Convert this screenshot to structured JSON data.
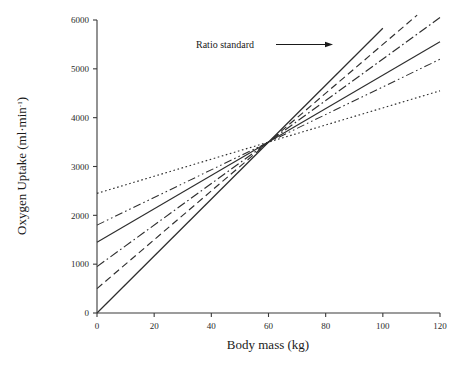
{
  "chart_data": {
    "type": "line",
    "title": "",
    "xlabel": "Body mass (kg)",
    "ylabel": "Oxygen Uptake (ml·min⁻¹)",
    "ylabel_base": "Oxygen Uptake (ml·min",
    "ylabel_sup": "-1",
    "ylabel_close": ")",
    "xlim": [
      0,
      120
    ],
    "ylim": [
      0,
      6000
    ],
    "xticks": [
      0,
      20,
      40,
      60,
      80,
      100,
      120
    ],
    "xtick_labels": [
      "0",
      "20",
      "40",
      "60",
      "80",
      "100",
      "120"
    ],
    "yticks": [
      0,
      1000,
      2000,
      3000,
      4000,
      5000,
      6000
    ],
    "ytick_labels": [
      "0",
      "1000",
      "2000",
      "3000",
      "4000",
      "5000",
      "6000"
    ],
    "grid": false,
    "legend": "none",
    "convergence_point": {
      "x": 60,
      "y": 3500
    },
    "series": [
      {
        "name": "Ratio standard",
        "style": "solid",
        "intercept": 0,
        "slope": 58.3,
        "x": [
          0,
          100
        ],
        "values": [
          0,
          5830
        ]
      },
      {
        "name": "Allometric line 1",
        "style": "dashed",
        "intercept": 500,
        "slope": 50.0,
        "x": [
          0,
          112
        ],
        "values": [
          500,
          6100
        ]
      },
      {
        "name": "Allometric line 2",
        "style": "dashdot",
        "intercept": 950,
        "slope": 42.5,
        "x": [
          0,
          120
        ],
        "values": [
          950,
          6050
        ]
      },
      {
        "name": "Allometric line 3",
        "style": "longdash",
        "intercept": 1450,
        "slope": 34.2,
        "x": [
          0,
          120
        ],
        "values": [
          1450,
          5554
        ]
      },
      {
        "name": "Allometric line 4",
        "style": "dashdotdot",
        "intercept": 1800,
        "slope": 28.3,
        "x": [
          0,
          120
        ],
        "values": [
          1800,
          5196
        ]
      },
      {
        "name": "Allometric line 5",
        "style": "dotted",
        "intercept": 2450,
        "slope": 17.5,
        "x": [
          0,
          120
        ],
        "values": [
          2450,
          4550
        ]
      }
    ],
    "annotations": [
      {
        "text": "Ratio standard",
        "x": 46,
        "y": 5600,
        "arrow_from": {
          "x": 53,
          "y": 5600
        },
        "arrow_to": {
          "x": 68,
          "y": 5600
        }
      }
    ],
    "colors": {
      "axis": "#3a3a3a",
      "line": "#2e2e2e",
      "text": "#1a1a1a",
      "background": "#ffffff"
    }
  }
}
